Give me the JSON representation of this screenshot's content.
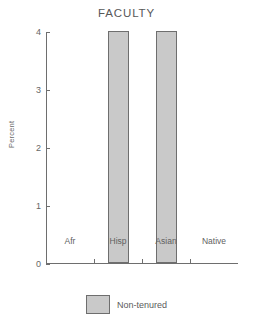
{
  "chart_data": {
    "type": "bar",
    "title": "FACULTY",
    "xlabel": "",
    "ylabel": "Percent",
    "categories": [
      "Afr",
      "Hisp",
      "Asian",
      "Native"
    ],
    "series": [
      {
        "name": "Non-tenured",
        "values": [
          0,
          4,
          4,
          0
        ],
        "color": "#c9c9c9"
      }
    ],
    "ylim": [
      0,
      4
    ],
    "yticks": [
      0,
      1,
      2,
      3,
      4
    ],
    "ytick_labels": [
      "0",
      "1",
      "2",
      "3",
      "4"
    ],
    "grid": false,
    "legend_position": "bottom"
  },
  "legend": {
    "entries": [
      {
        "label": "Non-tenured",
        "color": "#c9c9c9"
      }
    ]
  },
  "colors": {
    "bar_fill": "#c9c9c9",
    "bar_edge": "#6e6e6e",
    "axis": "#6e6e6e",
    "text": "#585858",
    "background": "#ffffff"
  }
}
